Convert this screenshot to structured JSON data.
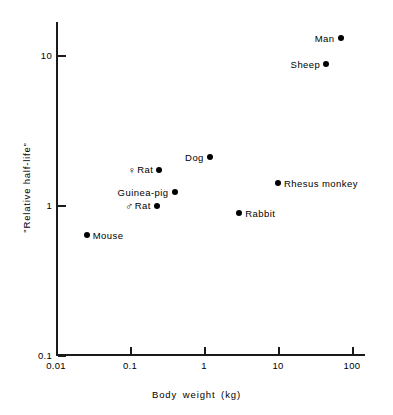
{
  "chart_data": {
    "type": "scatter",
    "title": "",
    "xlabel": "Body weight (kg)",
    "ylabel": "\"Relative half-life\"",
    "xscale": "log",
    "yscale": "log",
    "xlim": [
      0.01,
      200
    ],
    "ylim": [
      0.1,
      20
    ],
    "grid": false,
    "legend": "none",
    "xticks": [
      {
        "value": 0.01,
        "label": "0.01"
      },
      {
        "value": 0.1,
        "label": "0.1"
      },
      {
        "value": 1,
        "label": "1"
      },
      {
        "value": 10,
        "label": "10"
      },
      {
        "value": 100,
        "label": "100"
      }
    ],
    "yticks": [
      {
        "value": 0.1,
        "label": "0.1"
      },
      {
        "value": 1,
        "label": "1"
      },
      {
        "value": 10,
        "label": "10"
      }
    ],
    "marker": "filled-circle",
    "marker_color": "#000000",
    "points": [
      {
        "name": "Mouse",
        "label": "Mouse",
        "symbol": "",
        "x": 0.026,
        "y": 0.63,
        "label_side": "right"
      },
      {
        "name": "Rat-male",
        "label": "Rat",
        "symbol": "♂",
        "x": 0.23,
        "y": 0.98,
        "label_side": "left"
      },
      {
        "name": "Rat-female",
        "label": "Rat",
        "symbol": "♀",
        "x": 0.25,
        "y": 1.7,
        "label_side": "left"
      },
      {
        "name": "Guinea-pig",
        "label": "Guinea-pig",
        "symbol": "",
        "x": 0.4,
        "y": 1.22,
        "label_side": "left"
      },
      {
        "name": "Dog",
        "label": "Dog",
        "symbol": "",
        "x": 1.2,
        "y": 2.1,
        "label_side": "left"
      },
      {
        "name": "Rabbit",
        "label": "Rabbit",
        "symbol": "",
        "x": 3.0,
        "y": 0.88,
        "label_side": "right"
      },
      {
        "name": "Rhesus-monkey",
        "label": "Rhesus monkey",
        "symbol": "",
        "x": 10.0,
        "y": 1.4,
        "label_side": "right"
      },
      {
        "name": "Sheep",
        "label": "Sheep",
        "symbol": "",
        "x": 45.0,
        "y": 8.7,
        "label_side": "left"
      },
      {
        "name": "Man",
        "label": "Man",
        "symbol": "",
        "x": 70.0,
        "y": 13.0,
        "label_side": "left"
      }
    ]
  }
}
